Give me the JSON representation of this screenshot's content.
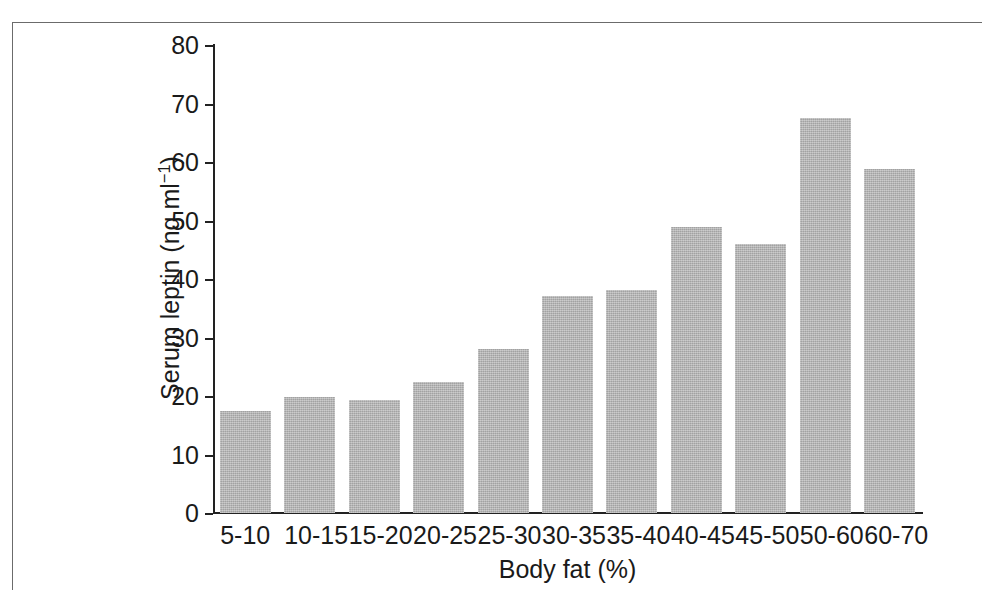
{
  "figure": {
    "background_color": "#ffffff",
    "frame_color": "#6b6b6b",
    "axis_color": "#222222"
  },
  "chart_data": {
    "type": "bar",
    "title": "",
    "xlabel": "Body fat (%)",
    "ylabel_text": "Serum leptin (ng ml",
    "ylabel_sup": "−1",
    "ylabel_tail": ")",
    "ylabel_full": "Serum leptin (ng ml⁻¹)",
    "categories": [
      "5-10",
      "10-15",
      "15-20",
      "20-25",
      "25-30",
      "30-35",
      "35-40",
      "40-45",
      "45-50",
      "50-60",
      "60-70"
    ],
    "values": [
      17.4,
      19.8,
      19.3,
      22.4,
      28.1,
      37.1,
      38.1,
      48.9,
      46.0,
      67.5,
      58.8
    ],
    "series": [
      {
        "name": "Serum leptin",
        "color": "#b2b2b2",
        "values": [
          17.4,
          19.8,
          19.3,
          22.4,
          28.1,
          37.1,
          38.1,
          48.9,
          46.0,
          67.5,
          58.8
        ]
      }
    ],
    "ylim": [
      0,
      80
    ],
    "xlim_categories": 11,
    "y_ticks": [
      0,
      10,
      20,
      30,
      40,
      50,
      60,
      70,
      80
    ],
    "y_tick_labels": [
      "0",
      "10",
      "20",
      "30",
      "40",
      "50",
      "60",
      "70",
      "80"
    ],
    "grid": false,
    "legend": false,
    "legend_position": "none",
    "bar_color": "#b2b2b2",
    "tick_direction": "out"
  }
}
